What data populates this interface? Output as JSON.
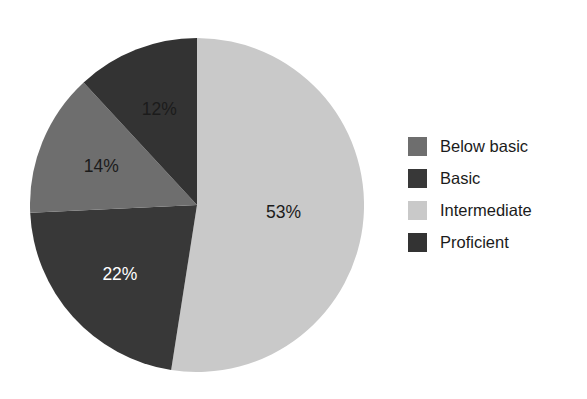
{
  "chart_data": {
    "type": "pie",
    "title": "",
    "subtitle": "",
    "xlabel": "",
    "ylabel": "",
    "grid": false,
    "legend_position": "right",
    "start_angle_deg": 0,
    "direction": "clockwise",
    "categories": [
      "Below basic",
      "Basic",
      "Intermediate",
      "Proficient"
    ],
    "values": [
      14,
      22,
      53,
      12
    ],
    "slices": [
      {
        "label": "Below basic",
        "value": 14,
        "data_label": "14%",
        "color": "#6e6e6e",
        "label_color": "#1b1b1b"
      },
      {
        "label": "Basic",
        "value": 22,
        "data_label": "22%",
        "color": "#383838",
        "label_color": "#ffffff"
      },
      {
        "label": "Intermediate",
        "value": 53,
        "data_label": "53%",
        "color": "#c9c9c9",
        "label_color": "#1b1b1b"
      },
      {
        "label": "Proficient",
        "value": 12,
        "data_label": "12%",
        "color": "#333333",
        "label_color": "#1b1b1b"
      }
    ],
    "draw_order": [
      "Intermediate",
      "Basic",
      "Below basic",
      "Proficient"
    ]
  },
  "legend": {
    "items": [
      {
        "label": "Below basic",
        "color": "#6e6e6e"
      },
      {
        "label": "Basic",
        "color": "#383838"
      },
      {
        "label": "Intermediate",
        "color": "#c9c9c9"
      },
      {
        "label": "Proficient",
        "color": "#333333"
      }
    ]
  },
  "pie_labels": {
    "intermediate": "53%",
    "basic": "22%",
    "below_basic": "14%",
    "proficient": "12%"
  },
  "colors": {
    "background": "#ffffff",
    "text": "#1b1b1b",
    "light_gray": "#c9c9c9",
    "mid_gray": "#6e6e6e",
    "dark_gray": "#383838",
    "darkest_gray": "#333333"
  }
}
